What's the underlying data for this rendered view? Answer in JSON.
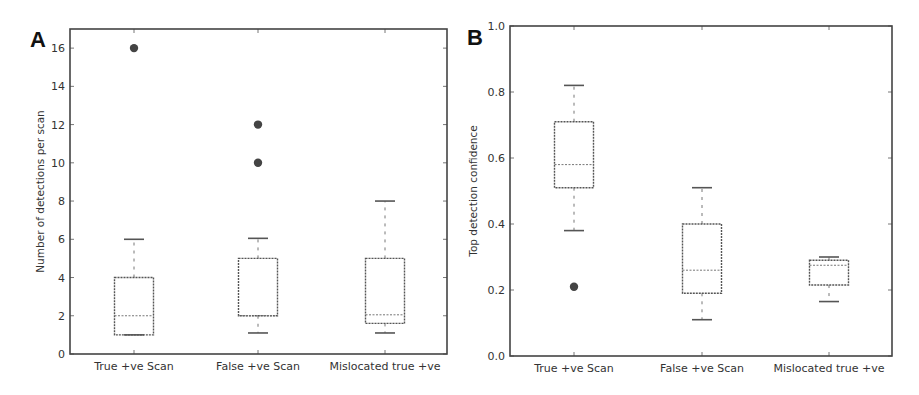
{
  "chart_data": [
    {
      "panel": "A",
      "type": "box",
      "title": "",
      "xlabel": "",
      "ylabel": "Number of detections per scan",
      "ylim": [
        0,
        17
      ],
      "yticks": [
        0,
        2,
        4,
        6,
        8,
        10,
        12,
        14,
        16
      ],
      "ytick_labels": [
        "0",
        "2",
        "4",
        "6",
        "8",
        "10",
        "12",
        "14",
        "16"
      ],
      "categories": [
        "True +ve Scan",
        "False +ve Scan",
        "Mislocated true +ve"
      ],
      "grid": false,
      "boxes": [
        {
          "category": "True +ve Scan",
          "whisker_low": 1,
          "q1": 1,
          "median": 2,
          "q3": 4,
          "whisker_high": 6,
          "outliers": [
            16
          ]
        },
        {
          "category": "False +ve Scan",
          "whisker_low": 1.1,
          "q1": 2,
          "median": 2,
          "q3": 5,
          "whisker_high": 6.05,
          "outliers": [
            12,
            10
          ]
        },
        {
          "category": "Mislocated true +ve",
          "whisker_low": 1.1,
          "q1": 1.6,
          "median": 2.05,
          "q3": 5,
          "whisker_high": 8,
          "outliers": []
        }
      ]
    },
    {
      "panel": "B",
      "type": "box",
      "title": "",
      "xlabel": "",
      "ylabel": "Top detection confidence",
      "ylim": [
        0.0,
        1.0
      ],
      "yticks": [
        0.0,
        0.2,
        0.4,
        0.6,
        0.8,
        1.0
      ],
      "ytick_labels": [
        "0.0",
        "0.2",
        "0.4",
        "0.6",
        "0.8",
        "1.0"
      ],
      "categories": [
        "True +ve Scan",
        "False +ve Scan",
        "Mislocated true +ve"
      ],
      "grid": false,
      "boxes": [
        {
          "category": "True +ve Scan",
          "whisker_low": 0.38,
          "q1": 0.51,
          "median": 0.58,
          "q3": 0.71,
          "whisker_high": 0.82,
          "outliers": [
            0.21
          ]
        },
        {
          "category": "False +ve Scan",
          "whisker_low": 0.11,
          "q1": 0.19,
          "median": 0.26,
          "q3": 0.4,
          "whisker_high": 0.51,
          "outliers": []
        },
        {
          "category": "Mislocated true +ve",
          "whisker_low": 0.165,
          "q1": 0.215,
          "median": 0.275,
          "q3": 0.29,
          "whisker_high": 0.3,
          "outliers": []
        }
      ]
    }
  ],
  "figure": {
    "panel_a_letter": "A",
    "panel_b_letter": "B"
  }
}
